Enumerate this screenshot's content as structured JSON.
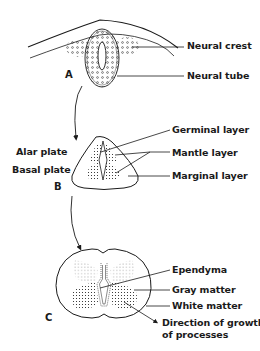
{
  "figure": {
    "stages": [
      {
        "id": "A",
        "label": "A",
        "labels": [
          "Neural crest",
          "Neural tube"
        ]
      },
      {
        "id": "B",
        "label": "B",
        "left_labels": [
          "Alar plate",
          "Basal plate"
        ],
        "labels": [
          "Germinal layer",
          "Mantle layer",
          "Marginal layer"
        ]
      },
      {
        "id": "C",
        "label": "C",
        "labels": [
          "Ependyma",
          "Gray matter",
          "White matter",
          "Direction of growth",
          "of processes"
        ]
      }
    ]
  },
  "colors": {
    "ink": "#1a1a1a",
    "background": "#ffffff"
  }
}
